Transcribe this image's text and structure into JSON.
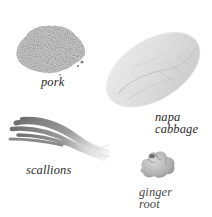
{
  "illustration": {
    "ingredients": [
      {
        "id": "pork",
        "label_lines": [
          "pork"
        ],
        "art": "ground-pork-illustration",
        "tone": "#7d7d7d"
      },
      {
        "id": "napa-cabbage",
        "label_lines": [
          "napa",
          "cabbage"
        ],
        "art": "napa-cabbage-illustration",
        "tone": "#e6e6e6"
      },
      {
        "id": "scallions",
        "label_lines": [
          "scallions"
        ],
        "art": "scallions-illustration",
        "tone": "#8a8a8a"
      },
      {
        "id": "ginger-root",
        "label_lines": [
          "ginger",
          "root"
        ],
        "art": "ginger-root-illustration",
        "tone": "#b5b5b5"
      }
    ]
  },
  "colors": {
    "background": "#ffffff",
    "label_text": "#2b2b2b"
  }
}
